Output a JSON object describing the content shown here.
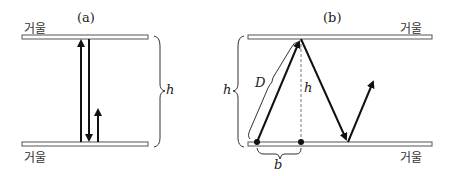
{
  "panels": {
    "a": {
      "label": "(a)",
      "mirror_top_label": "거울",
      "mirror_bottom_label": "거울",
      "height_label": "h"
    },
    "b": {
      "label": "(b)",
      "mirror_top_label": "거울",
      "mirror_bottom_label": "거울",
      "height_label_left": "h",
      "height_label_center": "h",
      "diagonal_label": "D",
      "base_label": "b"
    }
  },
  "colors": {
    "line": "#111111",
    "mirror_fill": "#ffffff",
    "mirror_stroke": "#555555",
    "dashed": "#777777"
  }
}
